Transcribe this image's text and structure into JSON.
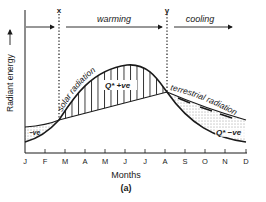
{
  "diagram": {
    "panel_label": "(a)",
    "y_axis_label": "Radiant energy",
    "x_axis_label": "Months",
    "months": [
      "J",
      "F",
      "M",
      "A",
      "M",
      "J",
      "J",
      "A",
      "S",
      "O",
      "N",
      "D"
    ],
    "markers": {
      "x": "x",
      "y": "y"
    },
    "phases": {
      "warming": "warming",
      "cooling": "cooling"
    },
    "curves": {
      "solar": "solar radiation",
      "terrestrial": "terrestrial radiation"
    },
    "regions": {
      "positive": "Q* +ve",
      "negative_right": "Q* −ve",
      "negative_left": "−ve"
    },
    "colors": {
      "ink": "#1a1a1a",
      "background": "#ffffff"
    }
  }
}
